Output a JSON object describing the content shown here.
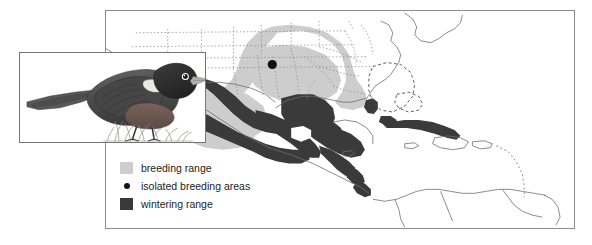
{
  "figure": {
    "background_color": "#ffffff"
  },
  "map": {
    "name": "range-map",
    "region": "North America, Central America, Caribbean and northern South America",
    "frame_color": "#8d8d8d",
    "land_outline_color": "#6e6e6e",
    "state_border_style": "dotted",
    "breeding_color": "#cdcdcd",
    "wintering_color": "#3a3a3a",
    "isolated_dot_color": "#111111",
    "dashed_outline_color": "#4a4a4a",
    "isolated_breeding_dot": {
      "x": 272,
      "y": 64
    }
  },
  "inset": {
    "name": "bird-illustration",
    "border_color": "#767676",
    "description": "perched dark bunting facing right, standing in grass",
    "plumage": {
      "head": "#2b2b2b",
      "back": "#4d4d4d",
      "breast": "#6a5550",
      "bill": "#b3b0aa",
      "eye_ring": "#ffffff",
      "grass": "#8b8b84"
    }
  },
  "legend": {
    "name": "map-legend",
    "items": [
      {
        "label": "breeding range",
        "key": "swatch",
        "color": "#cdcdcd"
      },
      {
        "label": "isolated breeding areas",
        "key": "dot",
        "color": "#111111"
      },
      {
        "label": "wintering range",
        "key": "swatch",
        "color": "#3a3a3a"
      }
    ]
  }
}
